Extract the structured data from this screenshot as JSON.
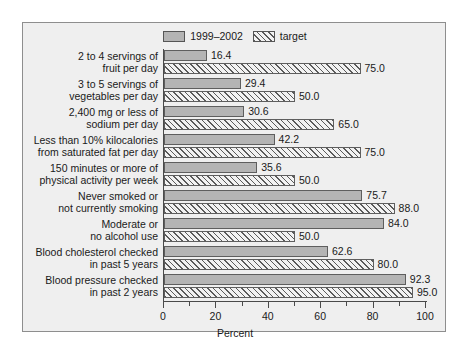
{
  "chart_data": {
    "type": "bar",
    "orientation": "horizontal",
    "title": "",
    "xlabel": "Percent",
    "ylabel": "",
    "xlim": [
      0,
      100
    ],
    "xticks": [
      0,
      20,
      40,
      60,
      80,
      100
    ],
    "xtick_labels": [
      "0",
      "20",
      "40",
      "60",
      "80",
      "100"
    ],
    "minor_xticks": [
      10,
      30,
      50,
      70,
      90
    ],
    "grid": false,
    "legend_position": "top-center",
    "categories": [
      "2 to 4 servings of fruit per day",
      "3 to 5 servings of vegetables per day",
      "2,400 mg or less of sodium per day",
      "Less than 10% kilocalories from saturated fat per day",
      "150 minutes or more of physical activity per week",
      "Never smoked or not currently smoking",
      "Moderate or no alcohol use",
      "Blood cholesterol checked in past 5 years",
      "Blood pressure checked in past 2 years"
    ],
    "category_lines": [
      [
        "2 to 4 servings of",
        "fruit per day"
      ],
      [
        "3 to 5 servings of",
        "vegetables per day"
      ],
      [
        "2,400 mg or less of",
        "sodium per day"
      ],
      [
        "Less than 10% kilocalories",
        "from saturated fat per day"
      ],
      [
        "150 minutes or more of",
        "physical activity per week"
      ],
      [
        "Never smoked or",
        "not currently smoking"
      ],
      [
        "Moderate or",
        "no alcohol use"
      ],
      [
        "Blood cholesterol checked",
        "in past 5 years"
      ],
      [
        "Blood pressure checked",
        "in past 2 years"
      ]
    ],
    "series": [
      {
        "name": "1999–2002",
        "style": "solid-gray",
        "color": "#b4b4b4",
        "values": [
          16.4,
          29.4,
          30.6,
          42.2,
          35.6,
          75.7,
          84.0,
          62.6,
          92.3
        ],
        "value_labels": [
          "16.4",
          "29.4",
          "30.6",
          "42.2",
          "35.6",
          "75.7",
          "84.0",
          "62.6",
          "92.3"
        ]
      },
      {
        "name": "target",
        "style": "hatched",
        "color": "#f2f2f2",
        "values": [
          75.0,
          50.0,
          65.0,
          75.0,
          50.0,
          88.0,
          50.0,
          80.0,
          95.0
        ],
        "value_labels": [
          "75.0",
          "50.0",
          "65.0",
          "75.0",
          "50.0",
          "88.0",
          "50.0",
          "80.0",
          "95.0"
        ]
      }
    ]
  },
  "legend": {
    "entries": [
      {
        "label": "1999–2002",
        "swatch": "solid"
      },
      {
        "label": "target",
        "swatch": "hatch"
      }
    ]
  },
  "colors": {
    "panel_background": "#efefef",
    "panel_border": "#8e8e8e",
    "bar_solid": "#b4b4b4",
    "bar_hatch_fill": "#f2f2f2",
    "bar_outline": "#5e5e5e",
    "axis": "#4a4a4a",
    "text": "#1a1a1a"
  }
}
